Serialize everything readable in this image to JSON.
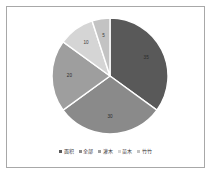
{
  "frame": {
    "border_color": "#a8a8a8",
    "background": "#ffffff"
  },
  "chart_data": {
    "type": "pie",
    "title": "",
    "subtitle": "",
    "xlabel": "",
    "ylabel": "",
    "grid": false,
    "legend_position": "bottom",
    "start_angle_deg": 0,
    "direction": "clockwise",
    "categories": [
      "面积",
      "全部",
      "灌木",
      "苗木",
      "竹竹"
    ],
    "values": [
      35,
      30,
      20,
      10,
      5
    ],
    "labels": [
      "35",
      "30",
      "20",
      "10",
      "5"
    ],
    "colors": [
      "#595959",
      "#8a8a8a",
      "#9e9e9e",
      "#d5d5d5",
      "#c3c3c3"
    ],
    "slices": [
      {
        "label": "面积",
        "value": 35,
        "value_label": "35",
        "color": "#595959",
        "label_on_dark": true
      },
      {
        "label": "全部",
        "value": 30,
        "value_label": "30",
        "color": "#8a8a8a",
        "label_on_dark": true
      },
      {
        "label": "灌木",
        "value": 20,
        "value_label": "20",
        "color": "#9e9e9e",
        "label_on_dark": true
      },
      {
        "label": "苗木",
        "value": 10,
        "value_label": "10",
        "color": "#d5d5d5",
        "label_on_dark": false
      },
      {
        "label": "竹竹",
        "value": 5,
        "value_label": "5",
        "color": "#c3c3c3",
        "label_on_dark": false
      }
    ]
  },
  "legend": {
    "items": [
      {
        "label": "面积",
        "color": "#595959"
      },
      {
        "label": "全部",
        "color": "#8a8a8a"
      },
      {
        "label": "灌木",
        "color": "#9e9e9e"
      },
      {
        "label": "苗木",
        "color": "#d5d5d5"
      },
      {
        "label": "竹竹",
        "color": "#c3c3c3"
      }
    ]
  }
}
